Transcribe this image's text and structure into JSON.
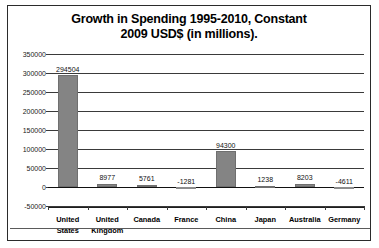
{
  "chart_data": {
    "type": "bar",
    "title": "Growth in Spending 1995-2010, Constant 2009 USD$ (in millions).",
    "title_line1": "Growth in Spending 1995-2010, Constant",
    "title_line2": "2009 USD$ (in millions).",
    "xlabel": "",
    "ylabel": "",
    "ylim": [
      -50000,
      350000
    ],
    "yticks": [
      350000,
      300000,
      250000,
      200000,
      150000,
      100000,
      50000,
      0,
      -50000
    ],
    "ytick_labels": [
      "350000",
      "300000",
      "250000",
      "200000",
      "150000",
      "100000",
      "50000",
      "0",
      "-50000"
    ],
    "grid": true,
    "legend": false,
    "categories": [
      "United States",
      "United Kingdom",
      "Canada",
      "France",
      "China",
      "Japan",
      "Australia",
      "Germany"
    ],
    "category_lines": [
      [
        "United",
        "States"
      ],
      [
        "United",
        "Kingdom"
      ],
      [
        "Canada",
        ""
      ],
      [
        "France",
        ""
      ],
      [
        "China",
        ""
      ],
      [
        "Japan",
        ""
      ],
      [
        "Australia",
        ""
      ],
      [
        "Germany",
        ""
      ]
    ],
    "values": [
      294504,
      8977,
      5761,
      -1281,
      94300,
      1238,
      8203,
      -4611
    ],
    "value_labels": [
      "294504",
      "8977",
      "5761",
      "-1281",
      "94300",
      "1238",
      "8203",
      "-4611"
    ],
    "bar_color": "#848484",
    "negative_bar_color": "#a6a6a6",
    "gridline_color": "#3a3a3a",
    "text_color": "#000000",
    "background": "#ffffff"
  }
}
